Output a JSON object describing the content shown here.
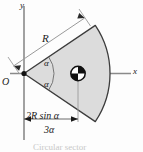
{
  "figure": {
    "caption": "Circular sector",
    "axes": {
      "y_label": "y",
      "x_label": "x",
      "origin_label": "O"
    },
    "labels": {
      "radius": "R",
      "angle_upper": "α",
      "angle_lower": "α"
    },
    "dimension": {
      "numerator": "2R sin α",
      "denominator": "3α"
    },
    "icons": {
      "centroid": "centroid-symbol",
      "arrow": "arrowhead"
    },
    "colors": {
      "sector_fill": "#dcdcdc",
      "sector_stroke": "#3c3c3c",
      "axis": "#808080",
      "dimension": "#9a9a9a",
      "text": "#1a1a1a",
      "background": "#fdfdfd"
    }
  }
}
